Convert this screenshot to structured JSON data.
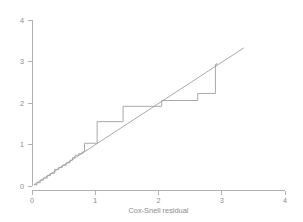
{
  "chart_data": {
    "type": "line",
    "title": "",
    "subtitle": "",
    "xlabel": "Cox-Snell residual",
    "ylabel": "",
    "xlim": [
      0,
      4
    ],
    "ylim": [
      0,
      4
    ],
    "xticks": [
      "0",
      "1",
      "2",
      "3",
      "4"
    ],
    "yticks": [
      "0",
      "1",
      "2",
      "3",
      "4"
    ],
    "xtick_values": [
      0,
      1,
      2,
      3,
      4
    ],
    "ytick_values": [
      0,
      1,
      2,
      3,
      4
    ],
    "grid": false,
    "legend": "none",
    "series": [
      {
        "name": "Nelson-Aalen cumulative hazard",
        "style": "step",
        "color": "#999999",
        "points": [
          [
            0.03,
            0.03
          ],
          [
            0.08,
            0.08
          ],
          [
            0.13,
            0.14
          ],
          [
            0.18,
            0.19
          ],
          [
            0.24,
            0.25
          ],
          [
            0.29,
            0.3
          ],
          [
            0.33,
            0.31
          ],
          [
            0.36,
            0.4
          ],
          [
            0.42,
            0.45
          ],
          [
            0.48,
            0.5
          ],
          [
            0.54,
            0.56
          ],
          [
            0.6,
            0.62
          ],
          [
            0.64,
            0.68
          ],
          [
            0.68,
            0.74
          ],
          [
            0.72,
            0.74
          ],
          [
            0.74,
            0.78
          ],
          [
            0.78,
            0.79
          ],
          [
            0.8,
            0.82
          ],
          [
            0.82,
            0.84
          ],
          [
            0.83,
            1.03
          ],
          [
            1.02,
            1.03
          ],
          [
            1.03,
            1.55
          ],
          [
            1.43,
            1.55
          ],
          [
            1.44,
            1.92
          ],
          [
            2.05,
            2.06
          ],
          [
            2.62,
            2.23
          ],
          [
            2.9,
            2.93
          ],
          [
            2.92,
            2.96
          ]
        ]
      },
      {
        "name": "45-degree reference line",
        "style": "straight",
        "color": "#999999",
        "points": [
          [
            0.03,
            0.03
          ],
          [
            3.35,
            3.33
          ]
        ]
      }
    ],
    "colors": {
      "background": "#ffffff",
      "axis": "#a8a8a8",
      "line": "#999999",
      "text": "#8a8a8a"
    }
  }
}
